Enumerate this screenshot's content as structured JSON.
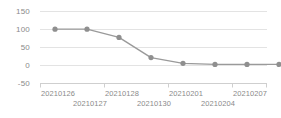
{
  "chart_data": {
    "type": "line",
    "title": "",
    "subtitle": "",
    "xlabel": "",
    "ylabel": "",
    "categories": [
      "20210126",
      "20210127",
      "20210128",
      "20210130",
      "20210201",
      "20210202",
      "20210204",
      "20210207"
    ],
    "x": [
      "20210126",
      "20210127",
      "20210128",
      "20210130",
      "20210201",
      "20210202",
      "20210204",
      "20210207"
    ],
    "values": [
      101,
      101,
      78,
      22,
      6,
      3,
      3,
      3
    ],
    "series": [
      {
        "name": "series-1",
        "values": [
          101,
          101,
          78,
          22,
          6,
          3,
          3,
          3
        ]
      }
    ],
    "ylim": [
      -50,
      150
    ],
    "yticks": [
      150,
      100,
      50,
      0,
      -50
    ],
    "ytick_labels": [
      "150",
      "100",
      "50",
      "0",
      "-50"
    ],
    "xtick_labels": [
      "20210126",
      "20210127",
      "20210128",
      "20210130",
      "20210201",
      "20210204",
      "20210207"
    ],
    "xtick_rows": [
      0,
      1,
      0,
      1,
      0,
      1,
      0
    ],
    "grid": true,
    "grid_axis": "y",
    "legend": false,
    "legend_position": "none",
    "line_color": "#9a9a9a",
    "marker_color": "#8f8f8f",
    "grid_color": "#e3e3e3",
    "axis_color": "#cfcfcf",
    "text_color": "#8a8a8a",
    "background": "#ffffff",
    "marker": "circle"
  }
}
